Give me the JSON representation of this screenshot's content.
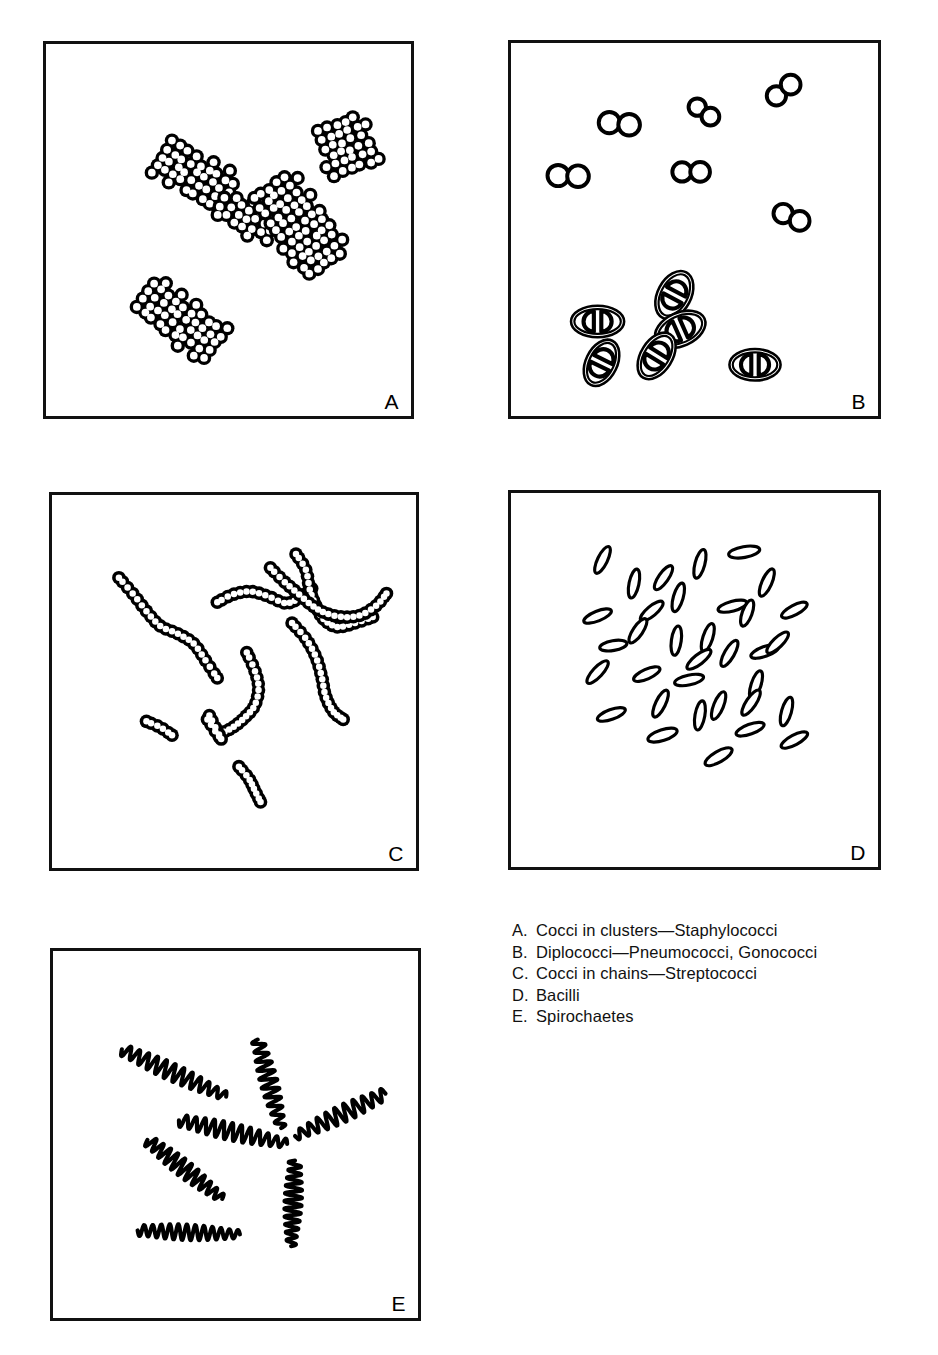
{
  "figure": {
    "background_color": "#ffffff",
    "ink_color": "#000000",
    "panel_border_color": "#111111"
  },
  "panels": [
    {
      "id": "panel-a",
      "letter": "A",
      "subject": "cocci-in-clusters",
      "morphology": "cluster",
      "cell_shape": "circle",
      "cell_diameter": 11,
      "stroke": 3.6,
      "clusters": [
        {
          "cx": 150,
          "cy": 135,
          "angle": -58,
          "rows": 9,
          "cols": 5,
          "spread": 1.0
        },
        {
          "cx": 203,
          "cy": 178,
          "angle": -62,
          "rows": 7,
          "cols": 4,
          "spread": 1.0
        },
        {
          "cx": 255,
          "cy": 185,
          "angle": -36,
          "rows": 11,
          "cols": 6,
          "spread": 1.0
        },
        {
          "cx": 303,
          "cy": 104,
          "angle": -20,
          "rows": 6,
          "cols": 6,
          "spread": 1.0
        },
        {
          "cx": 135,
          "cy": 282,
          "angle": -52,
          "rows": 10,
          "cols": 5,
          "spread": 1.0
        }
      ]
    },
    {
      "id": "panel-b",
      "letter": "B",
      "subject": "diplococci",
      "morphology": "pairs",
      "cell_shape": "circle",
      "plain_pairs": [
        {
          "cx": 110,
          "cy": 82,
          "angle": 6,
          "r": 11
        },
        {
          "cx": 196,
          "cy": 70,
          "angle": 36,
          "r": 9
        },
        {
          "cx": 277,
          "cy": 48,
          "angle": -38,
          "r": 10
        },
        {
          "cx": 58,
          "cy": 135,
          "angle": 2,
          "r": 11
        },
        {
          "cx": 183,
          "cy": 131,
          "angle": 0,
          "r": 10
        },
        {
          "cx": 285,
          "cy": 177,
          "angle": 24,
          "r": 10
        }
      ],
      "capsuled_pairs": [
        {
          "cx": 166,
          "cy": 256,
          "angle": -62,
          "rx": 26,
          "ry": 17
        },
        {
          "cx": 88,
          "cy": 283,
          "angle": 0,
          "rx": 27,
          "ry": 16
        },
        {
          "cx": 172,
          "cy": 291,
          "angle": -24,
          "rx": 27,
          "ry": 17
        },
        {
          "cx": 148,
          "cy": 318,
          "angle": -58,
          "rx": 26,
          "ry": 16
        },
        {
          "cx": 92,
          "cy": 325,
          "angle": -64,
          "rx": 25,
          "ry": 16
        },
        {
          "cx": 248,
          "cy": 327,
          "angle": 0,
          "rx": 26,
          "ry": 16
        }
      ]
    },
    {
      "id": "panel-c",
      "letter": "C",
      "subject": "cocci-in-chains",
      "morphology": "chain",
      "cell_shape": "circle",
      "cell_diameter": 10,
      "chains": [
        {
          "points": [
            [
              68,
              84
            ],
            [
              82,
              100
            ],
            [
              96,
              118
            ],
            [
              110,
              133
            ],
            [
              128,
              141
            ],
            [
              144,
              151
            ],
            [
              156,
              168
            ],
            [
              168,
              186
            ]
          ],
          "beads": 22
        },
        {
          "points": [
            [
              168,
              109
            ],
            [
              184,
              101
            ],
            [
              202,
              98
            ],
            [
              220,
              103
            ],
            [
              238,
              110
            ],
            [
              252,
              104
            ],
            [
              264,
              95
            ]
          ],
          "beads": 18
        },
        {
          "points": [
            [
              248,
              60
            ],
            [
              258,
              76
            ],
            [
              262,
              96
            ],
            [
              268,
              112
            ],
            [
              276,
              126
            ],
            [
              290,
              134
            ],
            [
              308,
              130
            ],
            [
              326,
              124
            ]
          ],
          "beads": 22
        },
        {
          "points": [
            [
              222,
              74
            ],
            [
              236,
              88
            ],
            [
              250,
              100
            ],
            [
              264,
              112
            ],
            [
              278,
              120
            ],
            [
              296,
              124
            ],
            [
              314,
              122
            ],
            [
              330,
              112
            ],
            [
              340,
              100
            ]
          ],
          "beads": 24
        },
        {
          "points": [
            [
              244,
              130
            ],
            [
              258,
              146
            ],
            [
              268,
              164
            ],
            [
              274,
              184
            ],
            [
              278,
              204
            ],
            [
              286,
              220
            ],
            [
              296,
              228
            ]
          ],
          "beads": 20
        },
        {
          "points": [
            [
              198,
              160
            ],
            [
              206,
              178
            ],
            [
              210,
              196
            ],
            [
              206,
              214
            ],
            [
              196,
              226
            ],
            [
              184,
              236
            ],
            [
              172,
              242
            ]
          ],
          "beads": 18
        },
        {
          "points": [
            [
              158,
              228
            ],
            [
              166,
              240
            ],
            [
              172,
              248
            ],
            [
              166,
              236
            ],
            [
              160,
              224
            ]
          ],
          "beads": 9
        },
        {
          "points": [
            [
              96,
              230
            ],
            [
              110,
              236
            ],
            [
              122,
              244
            ]
          ],
          "beads": 6
        },
        {
          "points": [
            [
              190,
              276
            ],
            [
              200,
              288
            ],
            [
              206,
              300
            ],
            [
              212,
              312
            ]
          ],
          "beads": 9
        }
      ]
    },
    {
      "id": "panel-d",
      "letter": "D",
      "subject": "bacilli",
      "morphology": "rods",
      "cell_shape": "ellipse",
      "rod_count": 38,
      "rod_length": 31,
      "rod_width": 10,
      "rods": [
        {
          "cx": 93,
          "cy": 68,
          "angle": -64,
          "len": 30,
          "wid": 10
        },
        {
          "cx": 155,
          "cy": 86,
          "angle": -55,
          "len": 29,
          "wid": 10
        },
        {
          "cx": 125,
          "cy": 92,
          "angle": -78,
          "len": 30,
          "wid": 10
        },
        {
          "cx": 192,
          "cy": 72,
          "angle": -75,
          "len": 30,
          "wid": 10
        },
        {
          "cx": 237,
          "cy": 60,
          "angle": -10,
          "len": 32,
          "wid": 11
        },
        {
          "cx": 260,
          "cy": 91,
          "angle": -66,
          "len": 30,
          "wid": 10
        },
        {
          "cx": 170,
          "cy": 106,
          "angle": -74,
          "len": 30,
          "wid": 10
        },
        {
          "cx": 143,
          "cy": 120,
          "angle": -40,
          "len": 29,
          "wid": 10
        },
        {
          "cx": 225,
          "cy": 115,
          "angle": -15,
          "len": 30,
          "wid": 10
        },
        {
          "cx": 240,
          "cy": 122,
          "angle": -70,
          "len": 28,
          "wid": 10
        },
        {
          "cx": 288,
          "cy": 119,
          "angle": -28,
          "len": 29,
          "wid": 10
        },
        {
          "cx": 88,
          "cy": 125,
          "angle": -22,
          "len": 30,
          "wid": 10
        },
        {
          "cx": 129,
          "cy": 140,
          "angle": -56,
          "len": 29,
          "wid": 10
        },
        {
          "cx": 104,
          "cy": 155,
          "angle": -10,
          "len": 28,
          "wid": 10
        },
        {
          "cx": 168,
          "cy": 150,
          "angle": -82,
          "len": 30,
          "wid": 10
        },
        {
          "cx": 200,
          "cy": 147,
          "angle": -72,
          "len": 30,
          "wid": 10
        },
        {
          "cx": 222,
          "cy": 163,
          "angle": -60,
          "len": 30,
          "wid": 10
        },
        {
          "cx": 258,
          "cy": 161,
          "angle": -20,
          "len": 30,
          "wid": 10
        },
        {
          "cx": 271,
          "cy": 152,
          "angle": -44,
          "len": 29,
          "wid": 10
        },
        {
          "cx": 191,
          "cy": 169,
          "angle": -38,
          "len": 30,
          "wid": 10
        },
        {
          "cx": 88,
          "cy": 182,
          "angle": -47,
          "len": 30,
          "wid": 10
        },
        {
          "cx": 138,
          "cy": 184,
          "angle": -24,
          "len": 29,
          "wid": 10
        },
        {
          "cx": 181,
          "cy": 190,
          "angle": -12,
          "len": 30,
          "wid": 10
        },
        {
          "cx": 249,
          "cy": 195,
          "angle": -72,
          "len": 30,
          "wid": 10
        },
        {
          "cx": 102,
          "cy": 225,
          "angle": -20,
          "len": 30,
          "wid": 10
        },
        {
          "cx": 152,
          "cy": 214,
          "angle": -64,
          "len": 30,
          "wid": 10
        },
        {
          "cx": 192,
          "cy": 226,
          "angle": -80,
          "len": 30,
          "wid": 10
        },
        {
          "cx": 211,
          "cy": 216,
          "angle": -68,
          "len": 30,
          "wid": 10
        },
        {
          "cx": 244,
          "cy": 213,
          "angle": -56,
          "len": 30,
          "wid": 10
        },
        {
          "cx": 280,
          "cy": 222,
          "angle": -74,
          "len": 30,
          "wid": 10
        },
        {
          "cx": 154,
          "cy": 246,
          "angle": -18,
          "len": 31,
          "wid": 11
        },
        {
          "cx": 243,
          "cy": 240,
          "angle": -20,
          "len": 30,
          "wid": 10
        },
        {
          "cx": 288,
          "cy": 251,
          "angle": -28,
          "len": 30,
          "wid": 10
        },
        {
          "cx": 211,
          "cy": 268,
          "angle": -30,
          "len": 31,
          "wid": 11
        }
      ]
    },
    {
      "id": "panel-e",
      "letter": "E",
      "subject": "spirochaetes",
      "morphology": "helical-filaments",
      "filament_count": 7,
      "stroke": 4.2,
      "filaments": [
        {
          "x1": 70,
          "y1": 100,
          "x2": 176,
          "y2": 148,
          "amp": 9,
          "waves": 12
        },
        {
          "x1": 208,
          "y1": 90,
          "x2": 232,
          "y2": 180,
          "amp": 9,
          "waves": 10
        },
        {
          "x1": 128,
          "y1": 172,
          "x2": 238,
          "y2": 196,
          "amp": 9,
          "waves": 12
        },
        {
          "x1": 338,
          "y1": 145,
          "x2": 246,
          "y2": 188,
          "amp": 9,
          "waves": 10
        },
        {
          "x1": 96,
          "y1": 192,
          "x2": 172,
          "y2": 252,
          "amp": 9,
          "waves": 11
        },
        {
          "x1": 86,
          "y1": 284,
          "x2": 190,
          "y2": 288,
          "amp": 8,
          "waves": 12
        },
        {
          "x1": 246,
          "y1": 213,
          "x2": 242,
          "y2": 300,
          "amp": 9,
          "waves": 11
        }
      ]
    }
  ],
  "legend": {
    "items": [
      {
        "key": "A.",
        "text": "Cocci in clusters—Staphylococci"
      },
      {
        "key": "B.",
        "text": "Diplococci—Pneumococci, Gonococci"
      },
      {
        "key": "C.",
        "text": "Cocci in chains—Streptococci"
      },
      {
        "key": "D.",
        "text": "Bacilli"
      },
      {
        "key": "E.",
        "text": "Spirochaetes"
      }
    ]
  }
}
